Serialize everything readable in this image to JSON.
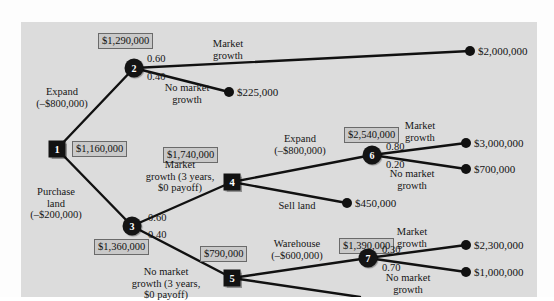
{
  "figure": {
    "type": "decision-tree",
    "background_color": "#dcdcdc",
    "node_color": "#121212",
    "ev_box_fill": "#c9c9c9",
    "ev_box_border": "#6a6a6a"
  },
  "nodes": [
    {
      "id": "1",
      "label": "1",
      "kind": "decision",
      "x": 57,
      "y": 149,
      "ev": "$1,160,000"
    },
    {
      "id": "2",
      "label": "2",
      "kind": "chance",
      "x": 134,
      "y": 68,
      "ev": "$1,290,000"
    },
    {
      "id": "3",
      "label": "3",
      "kind": "chance",
      "x": 132,
      "y": 226,
      "ev": "$1,360,000"
    },
    {
      "id": "4",
      "label": "4",
      "kind": "decision",
      "x": 232,
      "y": 182,
      "ev": "$1,740,000"
    },
    {
      "id": "5",
      "label": "5",
      "kind": "decision",
      "x": 232,
      "y": 278,
      "ev": "$790,000"
    },
    {
      "id": "6",
      "label": "6",
      "kind": "chance",
      "x": 372,
      "y": 155,
      "ev": "$2,540,000"
    },
    {
      "id": "7",
      "label": "7",
      "kind": "chance",
      "x": 368,
      "y": 258,
      "ev": "$1,390,000"
    }
  ],
  "ev_boxes": [
    {
      "name": "ev-node-2",
      "value": "$1,290,000",
      "x": 98,
      "y": 33
    },
    {
      "name": "ev-node-1",
      "value": "$1,160,000",
      "x": 72,
      "y": 141
    },
    {
      "name": "ev-node-4",
      "value": "$1,740,000",
      "x": 163,
      "y": 147
    },
    {
      "name": "ev-node-6",
      "value": "$2,540,000",
      "x": 344,
      "y": 127
    },
    {
      "name": "ev-node-3",
      "value": "$1,360,000",
      "x": 94,
      "y": 239
    },
    {
      "name": "ev-node-5",
      "value": "$790,000",
      "x": 200,
      "y": 246
    },
    {
      "name": "ev-node-7",
      "value": "$1,390,000",
      "x": 339,
      "y": 238
    }
  ],
  "branch_labels": [
    {
      "name": "branch-expand-from-1",
      "lines": [
        "Expand",
        "(–$800,000)"
      ],
      "x": 62,
      "y": 86,
      "align": "center"
    },
    {
      "name": "branch-purchase-land",
      "lines": [
        "Purchase",
        "land",
        "(–$200,000)"
      ],
      "x": 56,
      "y": 186,
      "align": "center"
    },
    {
      "name": "branch-market-growth-2",
      "lines": [
        "Market",
        "growth"
      ],
      "x": 228,
      "y": 38,
      "align": "center"
    },
    {
      "name": "branch-no-market-growth-2",
      "lines": [
        "No market",
        "growth"
      ],
      "x": 187,
      "y": 82,
      "align": "center"
    },
    {
      "name": "branch-market-growth-3",
      "lines": [
        "Market",
        "growth (3 years,",
        "$0 payoff)"
      ],
      "x": 180,
      "y": 159,
      "align": "center"
    },
    {
      "name": "branch-no-market-growth-3",
      "lines": [
        "No market",
        "growth (3 years,",
        "$0 payoff)"
      ],
      "x": 166,
      "y": 266,
      "align": "center"
    },
    {
      "name": "branch-expand-from-4",
      "lines": [
        "Expand",
        "(–$800,000)"
      ],
      "x": 300,
      "y": 133,
      "align": "center"
    },
    {
      "name": "branch-sell-land",
      "lines": [
        "Sell land"
      ],
      "x": 297,
      "y": 200,
      "align": "center"
    },
    {
      "name": "branch-warehouse",
      "lines": [
        "Warehouse",
        "(–$600,000)"
      ],
      "x": 297,
      "y": 238,
      "align": "center"
    },
    {
      "name": "branch-market-growth-6",
      "lines": [
        "Market",
        "growth"
      ],
      "x": 420,
      "y": 120,
      "align": "center"
    },
    {
      "name": "branch-no-market-growth-6",
      "lines": [
        "No market",
        "growth"
      ],
      "x": 412,
      "y": 168,
      "align": "center"
    },
    {
      "name": "branch-market-growth-7",
      "lines": [
        "Market",
        "growth"
      ],
      "x": 412,
      "y": 226,
      "align": "center"
    },
    {
      "name": "branch-no-market-growth-7",
      "lines": [
        "No market",
        "growth"
      ],
      "x": 408,
      "y": 272,
      "align": "center"
    }
  ],
  "probabilities": [
    {
      "name": "prob-2-market-growth",
      "value": "0.60",
      "x": 147,
      "y": 53
    },
    {
      "name": "prob-2-no-market-growth",
      "value": "0.40",
      "x": 147,
      "y": 71
    },
    {
      "name": "prob-3-market-growth",
      "value": "0.60",
      "x": 148,
      "y": 212
    },
    {
      "name": "prob-3-no-market-growth",
      "value": "0.40",
      "x": 148,
      "y": 229
    },
    {
      "name": "prob-6-market-growth",
      "value": "0.80",
      "x": 386,
      "y": 141
    },
    {
      "name": "prob-6-no-market-growth",
      "value": "0.20",
      "x": 386,
      "y": 159
    },
    {
      "name": "prob-7-market-growth",
      "value": "0.30",
      "x": 382,
      "y": 244
    },
    {
      "name": "prob-7-no-market-growth",
      "value": "0.70",
      "x": 382,
      "y": 262
    }
  ],
  "endpoints": [
    {
      "name": "payoff-2000000",
      "value": "$2,000,000",
      "x": 470,
      "y": 51,
      "label_x": 478,
      "label_y": 45
    },
    {
      "name": "payoff-225000",
      "value": "$225,000",
      "x": 229,
      "y": 92,
      "label_x": 237,
      "label_y": 86
    },
    {
      "name": "payoff-3000000",
      "value": "$3,000,000",
      "x": 466,
      "y": 143,
      "label_x": 474,
      "label_y": 137
    },
    {
      "name": "payoff-700000",
      "value": "$700,000",
      "x": 466,
      "y": 169,
      "label_x": 474,
      "label_y": 163
    },
    {
      "name": "payoff-450000",
      "value": "$450,000",
      "x": 347,
      "y": 203,
      "label_x": 355,
      "label_y": 197
    },
    {
      "name": "payoff-2300000",
      "value": "$2,300,000",
      "x": 466,
      "y": 245,
      "label_x": 474,
      "label_y": 239
    },
    {
      "name": "payoff-1000000",
      "value": "$1,000,000",
      "x": 466,
      "y": 272,
      "label_x": 474,
      "label_y": 266
    }
  ],
  "edges": [
    {
      "name": "edge-1-to-2",
      "x1": 57,
      "y1": 149,
      "x2": 134,
      "y2": 68
    },
    {
      "name": "edge-1-to-3",
      "x1": 57,
      "y1": 149,
      "x2": 132,
      "y2": 226
    },
    {
      "name": "edge-2-to-2000000",
      "x1": 134,
      "y1": 68,
      "x2": 470,
      "y2": 51
    },
    {
      "name": "edge-2-to-225000",
      "x1": 134,
      "y1": 68,
      "x2": 229,
      "y2": 92
    },
    {
      "name": "edge-3-to-4",
      "x1": 132,
      "y1": 226,
      "x2": 232,
      "y2": 182
    },
    {
      "name": "edge-3-to-5",
      "x1": 132,
      "y1": 226,
      "x2": 232,
      "y2": 278
    },
    {
      "name": "edge-4-to-6",
      "x1": 232,
      "y1": 182,
      "x2": 372,
      "y2": 155
    },
    {
      "name": "edge-4-to-450000",
      "x1": 232,
      "y1": 182,
      "x2": 347,
      "y2": 203
    },
    {
      "name": "edge-6-to-3000000",
      "x1": 372,
      "y1": 155,
      "x2": 466,
      "y2": 143
    },
    {
      "name": "edge-6-to-700000",
      "x1": 372,
      "y1": 155,
      "x2": 466,
      "y2": 169
    },
    {
      "name": "edge-5-to-7",
      "x1": 232,
      "y1": 278,
      "x2": 368,
      "y2": 258
    },
    {
      "name": "edge-5-down",
      "x1": 232,
      "y1": 278,
      "x2": 360,
      "y2": 297
    },
    {
      "name": "edge-7-to-2300000",
      "x1": 368,
      "y1": 258,
      "x2": 466,
      "y2": 245
    },
    {
      "name": "edge-7-to-1000000",
      "x1": 368,
      "y1": 258,
      "x2": 466,
      "y2": 272
    }
  ]
}
